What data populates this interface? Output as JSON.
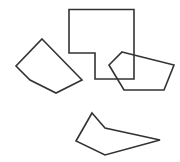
{
  "diagram": {
    "width": 180,
    "height": 162,
    "background": "#ffffff",
    "stroke_color": "#333333",
    "stroke_width": 1.6,
    "shapes": [
      {
        "id": "l-shape",
        "type": "polygon",
        "points": "69,9.5 134,9.5 134,79 95,79 95,53 69,53"
      },
      {
        "id": "pentagon-right",
        "type": "polygon",
        "points": "122,52 174,65 164,90 124,90 109,65"
      },
      {
        "id": "pentagon-left",
        "type": "polygon",
        "points": "42,39 82,80 56,93 30,80 16,66"
      },
      {
        "id": "pentagon-bottom",
        "type": "polygon",
        "points": "92,113 105,128 160,140 105,155 76,141"
      }
    ]
  }
}
